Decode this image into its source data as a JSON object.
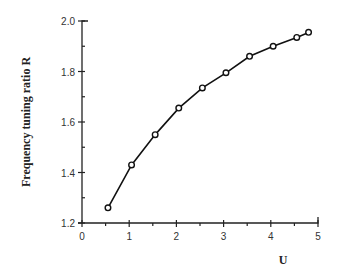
{
  "chart_data": {
    "type": "line",
    "title": "",
    "xlabel": "U",
    "ylabel": "Frequency  tuning  ratio  R",
    "xlim": [
      0,
      5
    ],
    "ylim": [
      1.2,
      2.0
    ],
    "xticks": [
      "0",
      "1",
      "2",
      "3",
      "4",
      "5"
    ],
    "yticks": [
      "1.2",
      "1.4",
      "1.6",
      "1.8",
      "2.0"
    ],
    "grid": false,
    "legend": null,
    "series": [
      {
        "name": "R vs U",
        "marker": "open-circle",
        "x": [
          0.55,
          1.05,
          1.55,
          2.05,
          2.55,
          3.05,
          3.55,
          4.05,
          4.55,
          4.8
        ],
        "y": [
          1.26,
          1.43,
          1.55,
          1.655,
          1.735,
          1.795,
          1.86,
          1.9,
          1.935,
          1.955
        ]
      }
    ]
  }
}
